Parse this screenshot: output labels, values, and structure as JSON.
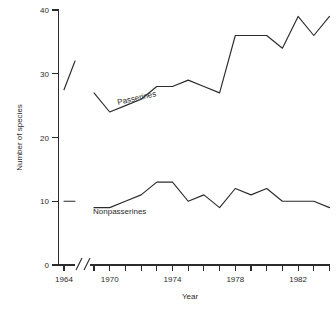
{
  "chart_data": {
    "type": "line",
    "title": "",
    "xlabel": "Year",
    "ylabel": "Number of species",
    "xlim": [
      1968.4,
      1984.2
    ],
    "ylim": [
      0,
      40
    ],
    "grid": false,
    "legend": "inline-labels",
    "y_ticks": [
      0,
      10,
      20,
      30,
      40
    ],
    "y_tick_labels": [
      "0",
      "10",
      "20",
      "30",
      "40"
    ],
    "x_tick_years": [
      1969,
      1970,
      1971,
      1972,
      1973,
      1974,
      1975,
      1976,
      1977,
      1978,
      1979,
      1980,
      1981,
      1982,
      1983,
      1984
    ],
    "x_labeled_years": [
      1964,
      1970,
      1974,
      1978,
      1982
    ],
    "x_tick_labels": [
      "1964",
      "1970",
      "1974",
      "1978",
      "1982"
    ],
    "axis_break": {
      "present": true,
      "after_label": "1964",
      "symbol": "//"
    },
    "series": [
      {
        "name": "Passerines",
        "label": "Passerines",
        "x": [
          1969,
          1970,
          1971,
          1972,
          1973,
          1974,
          1975,
          1976,
          1977,
          1978,
          1979,
          1980,
          1981,
          1982,
          1983,
          1984
        ],
        "values": [
          27,
          24,
          25,
          26,
          28,
          28,
          29,
          28,
          27,
          36,
          36,
          36,
          34,
          39,
          36,
          39
        ]
      },
      {
        "name": "Nonpasserines",
        "label": "Nonpasserines",
        "x": [
          1969,
          1970,
          1971,
          1972,
          1973,
          1974,
          1975,
          1976,
          1977,
          1978,
          1979,
          1980,
          1981,
          1982,
          1983,
          1984
        ],
        "values": [
          9,
          9,
          10,
          11,
          13,
          13,
          10,
          11,
          9,
          12,
          11,
          12,
          10,
          10,
          10,
          9
        ]
      }
    ],
    "pre_break_segments": [
      {
        "name": "Passerines 1964",
        "series": "Passerines",
        "x": [
          1964,
          1965.2
        ],
        "values": [
          27.5,
          32
        ]
      },
      {
        "name": "Nonpasserines 1964",
        "series": "Nonpasserines",
        "x": [
          1964,
          1965.2
        ],
        "values": [
          10,
          10
        ]
      }
    ]
  },
  "labels": {
    "y_axis_title": "Number of species",
    "x_axis_title": "Year",
    "passerines": "Passerines",
    "nonpasserines": "Nonpasserines",
    "y0": "0",
    "y10": "10",
    "y20": "20",
    "y30": "30",
    "y40": "40",
    "x1964": "1964",
    "x1970": "1970",
    "x1974": "1974",
    "x1978": "1978",
    "x1982": "1982"
  },
  "style": {
    "line_color": "#2b2b2b",
    "background": "#ffffff"
  }
}
